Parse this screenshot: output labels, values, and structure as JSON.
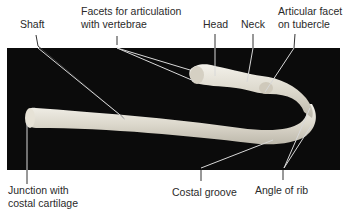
{
  "figure": {
    "subject": "rib",
    "background_color": "#0a0a0a",
    "bone_color": "#e8e4da"
  },
  "labels": {
    "shaft": "Shaft",
    "facets_line1": "Facets for articulation",
    "facets_line2": "with vertebrae",
    "head": "Head",
    "neck": "Neck",
    "articular_line1": "Articular facet",
    "articular_line2": "on tubercle",
    "junction_line1": "Junction with",
    "junction_line2": "costal cartilage",
    "costal_groove": "Costal groove",
    "angle_of_rib": "Angle of rib"
  }
}
